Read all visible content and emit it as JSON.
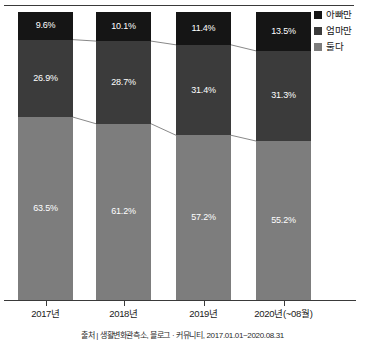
{
  "chart_data": {
    "type": "bar",
    "subtype": "100-percent-stacked-column",
    "title": "",
    "subtitle": "",
    "xlabel": "",
    "ylabel": "",
    "ylim": [
      0,
      100
    ],
    "grid": false,
    "legend_position": "right-top",
    "categories": [
      "2017년",
      "2018년",
      "2019년",
      "2020년(~08월)"
    ],
    "series": [
      {
        "name": "아빠만",
        "color": "#151515",
        "values": [
          9.6,
          10.1,
          11.4,
          13.5
        ],
        "labels": [
          "9.6%",
          "10.1%",
          "11.4%",
          "13.5%"
        ]
      },
      {
        "name": "엄마만",
        "color": "#3b3b3b",
        "values": [
          26.9,
          28.7,
          31.4,
          31.3
        ],
        "labels": [
          "26.9%",
          "28.7%",
          "31.4%",
          "31.3%"
        ]
      },
      {
        "name": "둘다",
        "color": "#7d7d7d",
        "values": [
          63.5,
          61.2,
          57.2,
          55.2
        ],
        "labels": [
          "63.5%",
          "61.2%",
          "57.2%",
          "55.2%"
        ]
      }
    ],
    "stack_order_top_to_bottom": [
      "아빠만",
      "엄마만",
      "둘다"
    ],
    "source_note": "출처 | 생활변화관측소, 블로그 · 커뮤니티, 2017.01.01~2020.08.31"
  },
  "legend": {
    "items": [
      {
        "label": "아빠만",
        "color": "#151515"
      },
      {
        "label": "엄마만",
        "color": "#3b3b3b"
      },
      {
        "label": "둘다",
        "color": "#7d7d7d"
      }
    ]
  },
  "axis": {
    "categories": [
      "2017년",
      "2018년",
      "2019년",
      "2020년(~08월)"
    ]
  },
  "footer": {
    "source": "출처 | 생활변화관측소, 블로그 · 커뮤니티, 2017.01.01~2020.08.31"
  }
}
